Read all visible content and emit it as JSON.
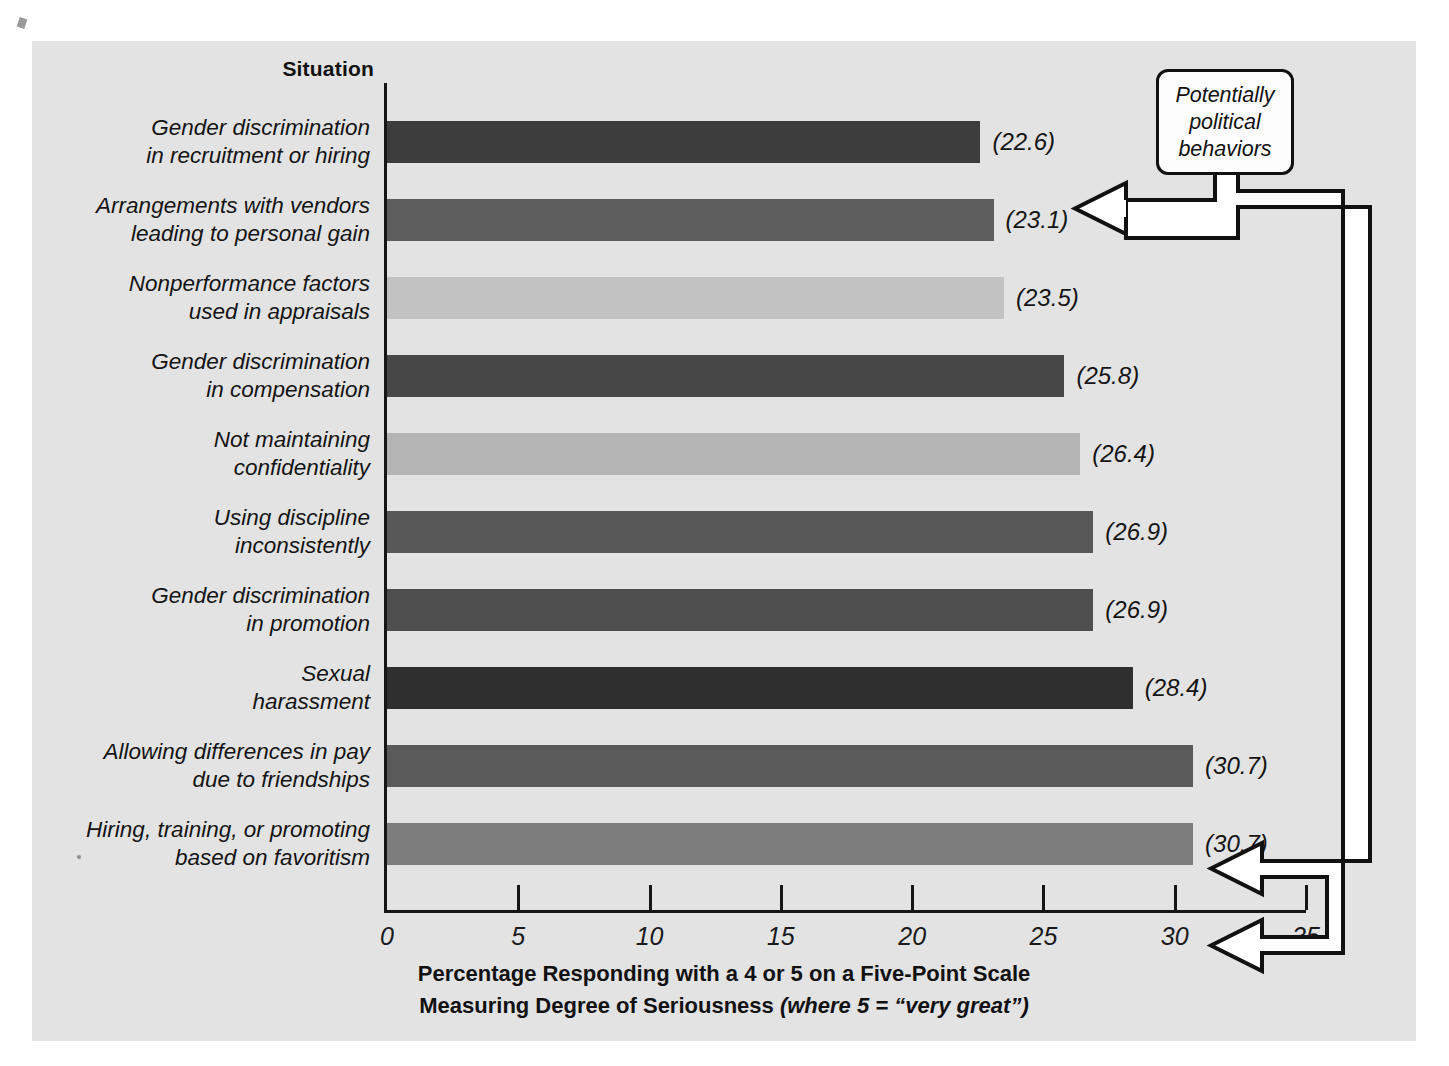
{
  "figure": {
    "axis_header": "Situation",
    "callout": "Potentially\npolitical\nbehaviors",
    "caption_line1": "Percentage Responding with a 4 or 5 on a Five-Point Scale",
    "caption_line2_bold": "Measuring Degree of Seriousness ",
    "caption_line2_italic": "(where 5 = “very great”)",
    "panel_bg": "#e3e3e3",
    "axis_color": "#161616"
  },
  "chart_data": {
    "type": "bar",
    "orientation": "horizontal",
    "title": "",
    "xlabel": "Percentage Responding with a 4 or 5 on a Five-Point Scale Measuring Degree of Seriousness (where 5 = “very great”)",
    "ylabel": "Situation",
    "xlim": [
      0,
      35
    ],
    "xticks": [
      "0",
      "5",
      "10",
      "15",
      "20",
      "25",
      "30",
      "35"
    ],
    "xtick_values": [
      0,
      5,
      10,
      15,
      20,
      25,
      30,
      35
    ],
    "grid": false,
    "legend": "none",
    "categories": [
      "Gender discrimination\nin recruitment or hiring",
      "Arrangements with vendors\nleading to personal gain",
      "Nonperformance factors\nused in appraisals",
      "Gender discrimination\nin compensation",
      "Not maintaining\nconfidentiality",
      "Using discipline\ninconsistently",
      "Gender discrimination\nin promotion",
      "Sexual\nharassment",
      "Allowing differences in pay\ndue to friendships",
      "Hiring, training, or promoting\nbased on favoritism"
    ],
    "values": [
      22.6,
      23.1,
      23.5,
      25.8,
      26.4,
      26.9,
      26.9,
      28.4,
      30.7,
      30.7
    ],
    "value_labels": [
      "(22.6)",
      "(23.1)",
      "(23.5)",
      "(25.8)",
      "(26.4)",
      "(26.9)",
      "(26.9)",
      "(28.4)",
      "(30.7)",
      "(30.7)"
    ],
    "bar_colors": [
      "#3d3d3d",
      "#5d5d5d",
      "#c2c2c2",
      "#474747",
      "#b4b4b4",
      "#585858",
      "#4e4e4e",
      "#2f2f2f",
      "#5a5a5a",
      "#7d7d7d"
    ],
    "annotations": [
      {
        "text": "Potentially political behaviors",
        "points_to": [
          "(23.1)",
          "(30.7)",
          "(30.7)"
        ]
      }
    ]
  }
}
